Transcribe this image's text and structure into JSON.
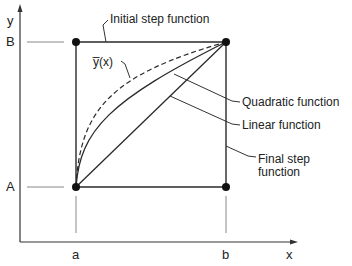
{
  "axes": {
    "x_label": "x",
    "y_label": "y",
    "x_ticks": [
      "a",
      "b"
    ],
    "y_ticks": [
      "A",
      "B"
    ]
  },
  "annotations": {
    "initial_step": "Initial step function",
    "ybar": "y̅(x)",
    "quadratic": "Quadratic function",
    "linear": "Linear function",
    "final_step_line1": "Final step",
    "final_step_line2": "function"
  },
  "points": [
    {
      "label": "(a, A)"
    },
    {
      "label": "(b, B)"
    }
  ],
  "colors": {
    "line": "#2a2a2a",
    "guide": "#8a8a8a"
  }
}
